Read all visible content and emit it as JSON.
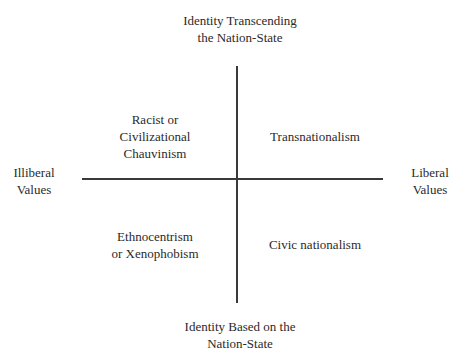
{
  "axes": {
    "top": "Identity Transcending\nthe Nation-State",
    "bottom": "Identity Based on the\nNation-State",
    "left": "Illiberal\nValues",
    "right": "Liberal\nValues"
  },
  "quadrants": {
    "top_left": "Racist or\nCivilizational\nChauvinism",
    "top_right": "Transnationalism",
    "bottom_left": "Ethnocentrism\nor Xenophobism",
    "bottom_right": "Civic nationalism"
  }
}
